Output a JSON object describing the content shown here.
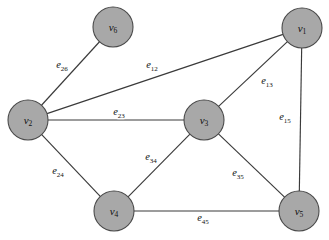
{
  "figure": {
    "kind": "undirected-graph-diagram",
    "background_color": "#ffffff",
    "node_fill_color": "#a8a8a8",
    "node_stroke_color": "#4a4a4a",
    "edge_color": "#3a3a3a",
    "label_color": "#111111"
  },
  "nodes": [
    {
      "id": "v6",
      "base": "v",
      "sub": "6",
      "label": "v6",
      "cx": 113,
      "cy": 27,
      "r": 20
    },
    {
      "id": "v1",
      "base": "v",
      "sub": "1",
      "label": "v1",
      "cx": 302,
      "cy": 28,
      "r": 20
    },
    {
      "id": "v2",
      "base": "v",
      "sub": "2",
      "label": "v2",
      "cx": 28,
      "cy": 120,
      "r": 20
    },
    {
      "id": "v3",
      "base": "v",
      "sub": "3",
      "label": "v3",
      "cx": 204,
      "cy": 120,
      "r": 20
    },
    {
      "id": "v4",
      "base": "v",
      "sub": "4",
      "label": "v4",
      "cx": 114,
      "cy": 211,
      "r": 20
    },
    {
      "id": "v5",
      "base": "v",
      "sub": "5",
      "label": "v5",
      "cx": 299,
      "cy": 211,
      "r": 20
    }
  ],
  "edges": [
    {
      "id": "e26",
      "base": "e",
      "sub": "26",
      "label": "e26",
      "source": "v2",
      "target": "v6",
      "label_x": 62,
      "label_y": 66
    },
    {
      "id": "e12",
      "base": "e",
      "sub": "12",
      "label": "e12",
      "source": "v1",
      "target": "v2",
      "label_x": 152,
      "label_y": 66
    },
    {
      "id": "e13",
      "base": "e",
      "sub": "13",
      "label": "e13",
      "source": "v1",
      "target": "v3",
      "label_x": 267,
      "label_y": 82
    },
    {
      "id": "e15",
      "base": "e",
      "sub": "15",
      "label": "e15",
      "source": "v1",
      "target": "v5",
      "label_x": 285,
      "label_y": 118
    },
    {
      "id": "e23",
      "base": "e",
      "sub": "23",
      "label": "e23",
      "source": "v2",
      "target": "v3",
      "label_x": 119,
      "label_y": 113
    },
    {
      "id": "e24",
      "base": "e",
      "sub": "24",
      "label": "e24",
      "source": "v2",
      "target": "v4",
      "label_x": 58,
      "label_y": 172
    },
    {
      "id": "e34",
      "base": "e",
      "sub": "34",
      "label": "e34",
      "source": "v3",
      "target": "v4",
      "label_x": 151,
      "label_y": 158
    },
    {
      "id": "e35",
      "base": "e",
      "sub": "35",
      "label": "e35",
      "source": "v3",
      "target": "v5",
      "label_x": 238,
      "label_y": 174
    },
    {
      "id": "e45",
      "base": "e",
      "sub": "45",
      "label": "e45",
      "source": "v4",
      "target": "v5",
      "label_x": 203,
      "label_y": 219
    }
  ]
}
